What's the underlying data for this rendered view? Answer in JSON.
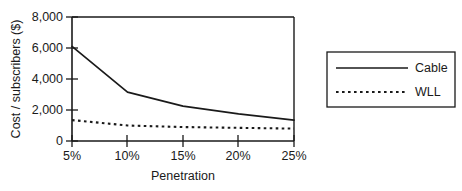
{
  "chart_data": {
    "type": "line",
    "title": "",
    "subtitle": "",
    "xlabel": "Penetration",
    "ylabel": "Cost / subscribers ($)",
    "x": [
      5,
      10,
      15,
      20,
      25
    ],
    "categories": [
      "5%",
      "10%",
      "15%",
      "20%",
      "25%"
    ],
    "xtick_labels": [
      "5%",
      "10%",
      "15%",
      "20%",
      "25%"
    ],
    "ytick_labels": [
      "0",
      "2,000",
      "4,000",
      "6,000",
      "8,000"
    ],
    "ytick_values": [
      0,
      2000,
      4000,
      6000,
      8000
    ],
    "xlim": [
      5,
      25
    ],
    "ylim": [
      0,
      8000
    ],
    "grid": false,
    "legend_position": "right-outside",
    "series": [
      {
        "name": "Cable",
        "style": "solid",
        "color": "#1a1a1a",
        "values": [
          6100,
          3150,
          2250,
          1750,
          1350
        ]
      },
      {
        "name": "WLL",
        "style": "dotted",
        "color": "#1a1a1a",
        "values": [
          1350,
          1000,
          900,
          850,
          800
        ]
      }
    ]
  },
  "axes": {
    "ylabel": "Cost / subscribers ($)",
    "xlabel": "Penetration",
    "ytick_0": "0",
    "ytick_2000": "2,000",
    "ytick_4000": "4,000",
    "ytick_6000": "6,000",
    "ytick_8000": "8,000",
    "xtick_5": "5%",
    "xtick_10": "10%",
    "xtick_15": "15%",
    "xtick_20": "20%",
    "xtick_25": "25%"
  },
  "legend": {
    "items": [
      {
        "label": "Cable",
        "style": "solid"
      },
      {
        "label": "WLL",
        "style": "dotted"
      }
    ],
    "item_0_label": "Cable",
    "item_1_label": "WLL"
  },
  "colors": {
    "ink": "#1a1a1a",
    "background": "#ffffff"
  }
}
